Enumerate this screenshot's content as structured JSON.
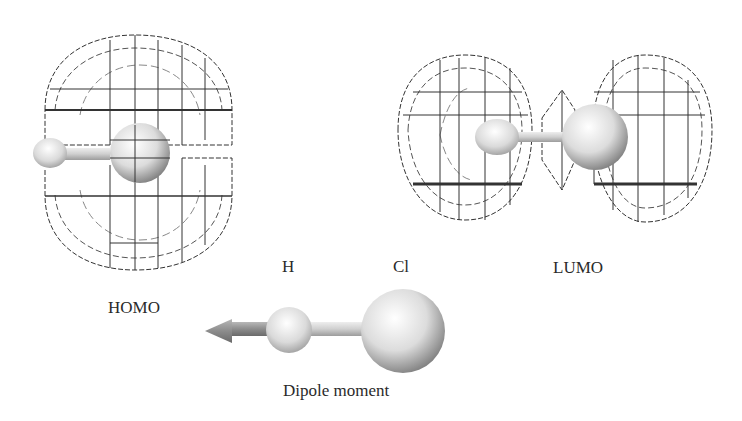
{
  "figure": {
    "homo": {
      "label": "HOMO"
    },
    "lumo": {
      "label": "LUMO"
    },
    "dipole": {
      "label": "Dipole moment",
      "atom_h": "H",
      "atom_cl": "Cl"
    }
  },
  "colors": {
    "wire": "#333333",
    "wire_light": "#888888",
    "sphere_light": "#f4f4f4",
    "sphere_dark": "#8a8a8a",
    "arrow": "#8c8c8c",
    "text": "#2a2a2a"
  }
}
